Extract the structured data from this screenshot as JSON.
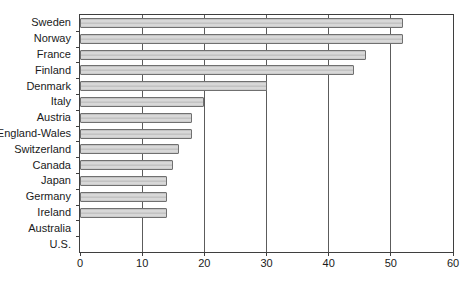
{
  "chart_data": {
    "type": "bar",
    "orientation": "horizontal",
    "title": "",
    "xlabel": "",
    "ylabel": "",
    "categories": [
      "Sweden",
      "Norway",
      "France",
      "Finland",
      "Denmark",
      "Italy",
      "Austria",
      "England-Wales",
      "Switzerland",
      "Canada",
      "Japan",
      "Germany",
      "Ireland",
      "Australia",
      "U.S."
    ],
    "values": [
      52,
      52,
      46,
      44,
      30,
      20,
      18,
      18,
      16,
      15,
      14,
      14,
      14,
      0,
      0
    ],
    "xlim": [
      0,
      60
    ],
    "xticks": [
      0,
      10,
      20,
      30,
      40,
      50,
      60
    ],
    "grid": "vertical gridlines at interior x ticks",
    "legend": "none"
  },
  "colors": {
    "background": "#ffffff",
    "bar_fill": "#d2d2d2",
    "bar_stripe": "#c3c3c3",
    "bar_border": "#707070",
    "frame": "#3f3f3f",
    "gridline": "#5c5c5c",
    "text": "#1a1a1a"
  }
}
